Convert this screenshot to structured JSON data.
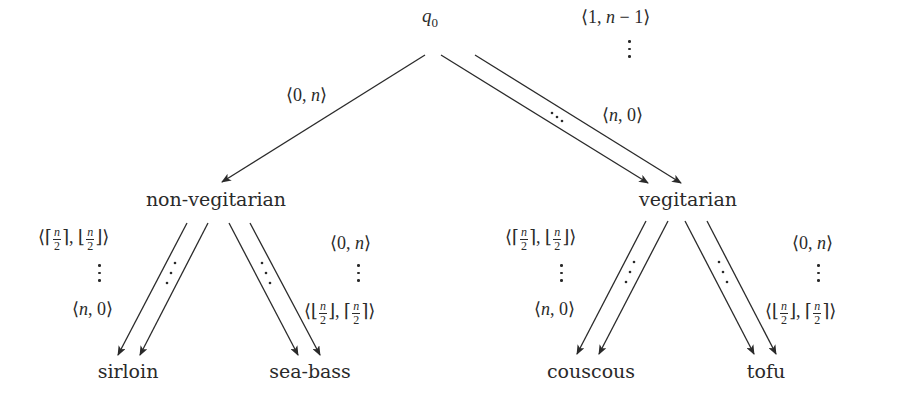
{
  "diagram": {
    "type": "tree",
    "root": {
      "id": "q0",
      "label_base": "q",
      "label_sub": "0"
    },
    "level1": [
      {
        "id": "non-vegitarian",
        "label": "non-vegitarian"
      },
      {
        "id": "vegitarian",
        "label": "vegitarian"
      }
    ],
    "leaves": [
      {
        "id": "sirloin",
        "label": "sirloin",
        "parent": "non-vegitarian"
      },
      {
        "id": "sea-bass",
        "label": "sea-bass",
        "parent": "non-vegitarian"
      },
      {
        "id": "couscous",
        "label": "couscous",
        "parent": "vegitarian"
      },
      {
        "id": "tofu",
        "label": "tofu",
        "parent": "vegitarian"
      }
    ],
    "edges": [
      {
        "from": "q0",
        "to": "non-vegitarian",
        "labels": [
          "⟨0, n⟩"
        ]
      },
      {
        "from": "q0",
        "to": "vegitarian",
        "labels": [
          "⟨1, n − 1⟩",
          "⋮",
          "⟨n, 0⟩"
        ]
      },
      {
        "from": "non-vegitarian",
        "to": "sirloin",
        "labels": [
          "⟨⌈n/2⌉, ⌊n/2⌋⟩",
          "⋮",
          "⟨n, 0⟩"
        ]
      },
      {
        "from": "non-vegitarian",
        "to": "sea-bass",
        "labels": [
          "⟨0, n⟩",
          "⋮",
          "⟨⌊n/2⌋, ⌈n/2⌉⟩"
        ]
      },
      {
        "from": "vegitarian",
        "to": "couscous",
        "labels": [
          "⟨⌈n/2⌉, ⌊n/2⌋⟩",
          "⋮",
          "⟨n, 0⟩"
        ]
      },
      {
        "from": "vegitarian",
        "to": "tofu",
        "labels": [
          "⟨0, n⟩",
          "⋮",
          "⟨⌊n/2⌋, ⌈n/2⌉⟩"
        ]
      }
    ],
    "text": {
      "langle": "⟨",
      "rangle": "⟩",
      "comma": ",",
      "zero": "0",
      "one": "1",
      "n": "n",
      "minus_one": "− 1",
      "two": "2",
      "lceil": "⌈",
      "rceil": "⌉",
      "lfloor": "⌊",
      "rfloor": "⌋"
    },
    "colors": {
      "line": "#2a2a2a",
      "background": "#ffffff"
    }
  }
}
